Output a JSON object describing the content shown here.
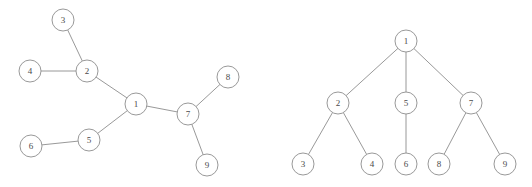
{
  "figure": {
    "background_color": "#ffffff",
    "stroke_color": "#8d8d8d",
    "label_color": "#4a4a4a",
    "node_radius": 11,
    "width": 532,
    "height": 187
  },
  "diagrams": [
    {
      "id": "left-graph",
      "name": "free-tree",
      "type": "undirected-graph",
      "nodes": [
        {
          "id": "1",
          "label": "1",
          "x": 136,
          "y": 104
        },
        {
          "id": "2",
          "label": "2",
          "x": 87,
          "y": 71
        },
        {
          "id": "3",
          "label": "3",
          "x": 63,
          "y": 20
        },
        {
          "id": "4",
          "label": "4",
          "x": 30,
          "y": 71
        },
        {
          "id": "5",
          "label": "5",
          "x": 89,
          "y": 140
        },
        {
          "id": "6",
          "label": "6",
          "x": 31,
          "y": 146
        },
        {
          "id": "7",
          "label": "7",
          "x": 188,
          "y": 114
        },
        {
          "id": "8",
          "label": "8",
          "x": 228,
          "y": 77
        },
        {
          "id": "9",
          "label": "9",
          "x": 207,
          "y": 165
        }
      ],
      "edges": [
        {
          "from": "3",
          "to": "2"
        },
        {
          "from": "4",
          "to": "2"
        },
        {
          "from": "2",
          "to": "1"
        },
        {
          "from": "1",
          "to": "5"
        },
        {
          "from": "5",
          "to": "6"
        },
        {
          "from": "1",
          "to": "7"
        },
        {
          "from": "7",
          "to": "8"
        },
        {
          "from": "7",
          "to": "9"
        }
      ]
    },
    {
      "id": "right-graph",
      "name": "rooted-tree",
      "type": "rooted-tree",
      "nodes": [
        {
          "id": "1",
          "label": "1",
          "x": 406,
          "y": 41
        },
        {
          "id": "2",
          "label": "2",
          "x": 338,
          "y": 103
        },
        {
          "id": "5",
          "label": "5",
          "x": 406,
          "y": 103
        },
        {
          "id": "7",
          "label": "7",
          "x": 471,
          "y": 103
        },
        {
          "id": "3",
          "label": "3",
          "x": 303,
          "y": 164
        },
        {
          "id": "4",
          "label": "4",
          "x": 372,
          "y": 164
        },
        {
          "id": "6",
          "label": "6",
          "x": 406,
          "y": 164
        },
        {
          "id": "8",
          "label": "8",
          "x": 439,
          "y": 164
        },
        {
          "id": "9",
          "label": "9",
          "x": 505,
          "y": 164
        }
      ],
      "edges": [
        {
          "from": "1",
          "to": "2"
        },
        {
          "from": "1",
          "to": "5"
        },
        {
          "from": "1",
          "to": "7"
        },
        {
          "from": "2",
          "to": "3"
        },
        {
          "from": "2",
          "to": "4"
        },
        {
          "from": "5",
          "to": "6"
        },
        {
          "from": "7",
          "to": "8"
        },
        {
          "from": "7",
          "to": "9"
        }
      ]
    }
  ]
}
